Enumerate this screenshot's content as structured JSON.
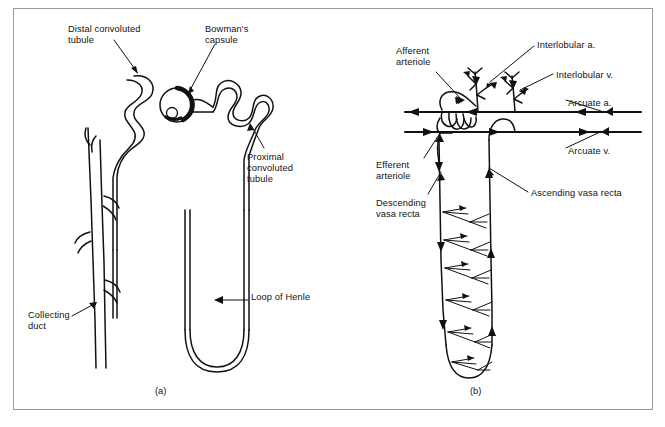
{
  "figure": {
    "background_color": "#ffffff",
    "ink_color": "#111111",
    "frame_color": "#9a9a9a",
    "panels": [
      {
        "id": "a",
        "caption": "(a)",
        "title": "nephron"
      },
      {
        "id": "b",
        "caption": "(b)",
        "title": "renal blood supply"
      }
    ]
  },
  "panel_a": {
    "caption": "(a)",
    "labels": [
      {
        "id": "distal-convoluted-tubule",
        "text": "Distal convoluted\ntubule",
        "x": 68,
        "y": 24
      },
      {
        "id": "bowmans-capsule",
        "text": "Bowman's\ncapsule",
        "x": 205,
        "y": 24
      },
      {
        "id": "proximal-convoluted-tubule",
        "text": "Proximal\nconvoluted\ntubule",
        "x": 247,
        "y": 152
      },
      {
        "id": "loop-of-henle",
        "text": "Loop of Henle",
        "x": 251,
        "y": 292
      },
      {
        "id": "collecting-duct",
        "text": "Collecting\nduct",
        "x": 28,
        "y": 310
      }
    ]
  },
  "panel_b": {
    "caption": "(b)",
    "labels": [
      {
        "id": "afferent-arteriole",
        "text": "Afferent\narteriole",
        "x": 396,
        "y": 46
      },
      {
        "id": "interlobular-a",
        "text": "Interlobular a.",
        "x": 537,
        "y": 40
      },
      {
        "id": "interlobular-v",
        "text": "Interlobular v.",
        "x": 556,
        "y": 70
      },
      {
        "id": "arcuate-a",
        "text": "Arcuate a.",
        "x": 568,
        "y": 98
      },
      {
        "id": "arcuate-v",
        "text": "Arcuate v.",
        "x": 568,
        "y": 146
      },
      {
        "id": "efferent-arteriole",
        "text": "Efferent\narteriole",
        "x": 376,
        "y": 160
      },
      {
        "id": "descending-vasa-recta",
        "text": "Descending\nvasa recta",
        "x": 376,
        "y": 198
      },
      {
        "id": "ascending-vasa-recta",
        "text": "Ascending vasa recta",
        "x": 531,
        "y": 188
      }
    ]
  }
}
